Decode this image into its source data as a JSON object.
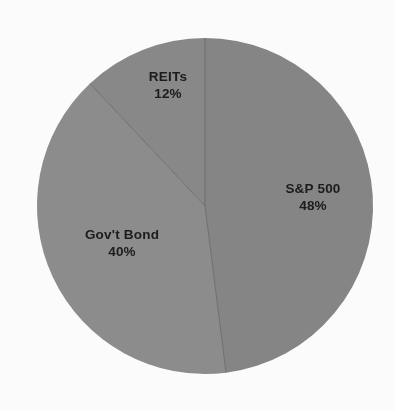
{
  "chart_data": {
    "type": "pie",
    "title": "",
    "subtitle": "",
    "xlabel": "",
    "ylabel": "",
    "categories": [
      "S&P 500",
      "Gov't Bond",
      "REITs"
    ],
    "values": [
      48,
      40,
      12
    ],
    "value_unit": "%",
    "value_labels": [
      "48%",
      "40%",
      "12%"
    ],
    "slices": [
      {
        "label": "S&P 500",
        "value": 48,
        "value_label": "48%",
        "color": "#878787",
        "start_angle_deg": 0,
        "end_angle_deg": 172.8
      },
      {
        "label": "Gov't Bond",
        "value": 40,
        "value_label": "40%",
        "color": "#8e8e8e",
        "start_angle_deg": 172.8,
        "end_angle_deg": 316.8
      },
      {
        "label": "REITs",
        "value": 12,
        "value_label": "12%",
        "color": "#8a8a8a",
        "start_angle_deg": 316.8,
        "end_angle_deg": 360
      }
    ],
    "start_angle_deg": 0,
    "direction": "clockwise",
    "legend": "none",
    "legend_position": "none",
    "grid": false,
    "labels_inside": true,
    "total": 100,
    "background_color": "#ffffff",
    "label_text_color": "#1c1c1c",
    "divider_color": "#6f6f6f",
    "geometry": {
      "center_x": 205,
      "center_y": 206,
      "radius": 168
    }
  }
}
